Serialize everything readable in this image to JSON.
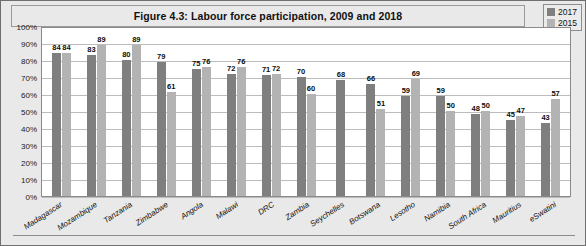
{
  "figure": {
    "title": "Figure 4.3: Labour force participation, 2009 and 2018"
  },
  "legend": {
    "position": "top-right",
    "items": [
      {
        "label": "2017",
        "color": "#7f7f7f"
      },
      {
        "label": "2015",
        "color": "#b3b3b3"
      }
    ]
  },
  "axis": {
    "y_ticks": [
      "100%",
      "90%",
      "80%",
      "70%",
      "60%",
      "50%",
      "40%",
      "30%",
      "20%",
      "10%",
      "0%"
    ]
  },
  "chart_data": {
    "type": "bar",
    "title": "Figure 4.3: Labour force participation, 2009 and 2018",
    "xlabel": "",
    "ylabel": "",
    "ylim": [
      0,
      100
    ],
    "ytick_step": 10,
    "grid": true,
    "legend_position": "top-right",
    "categories": [
      "Madagascar",
      "Mozambique",
      "Tanzania",
      "Zimbabwe",
      "Angola",
      "Malawi",
      "DRC",
      "Zambia",
      "Seychelles",
      "Botswana",
      "Lesotho",
      "Namibia",
      "South Africa",
      "Mauritius",
      "eSwatini"
    ],
    "series": [
      {
        "name": "2017",
        "color": "#7f7f7f",
        "values": [
          84,
          83,
          80,
          79,
          75,
          72,
          71,
          70,
          68,
          66,
          59,
          59,
          48,
          45,
          43
        ]
      },
      {
        "name": "2015",
        "color": "#b3b3b3",
        "values": [
          84,
          89,
          89,
          61,
          76,
          76,
          72,
          60,
          null,
          51,
          69,
          50,
          50,
          47,
          57
        ]
      }
    ]
  }
}
